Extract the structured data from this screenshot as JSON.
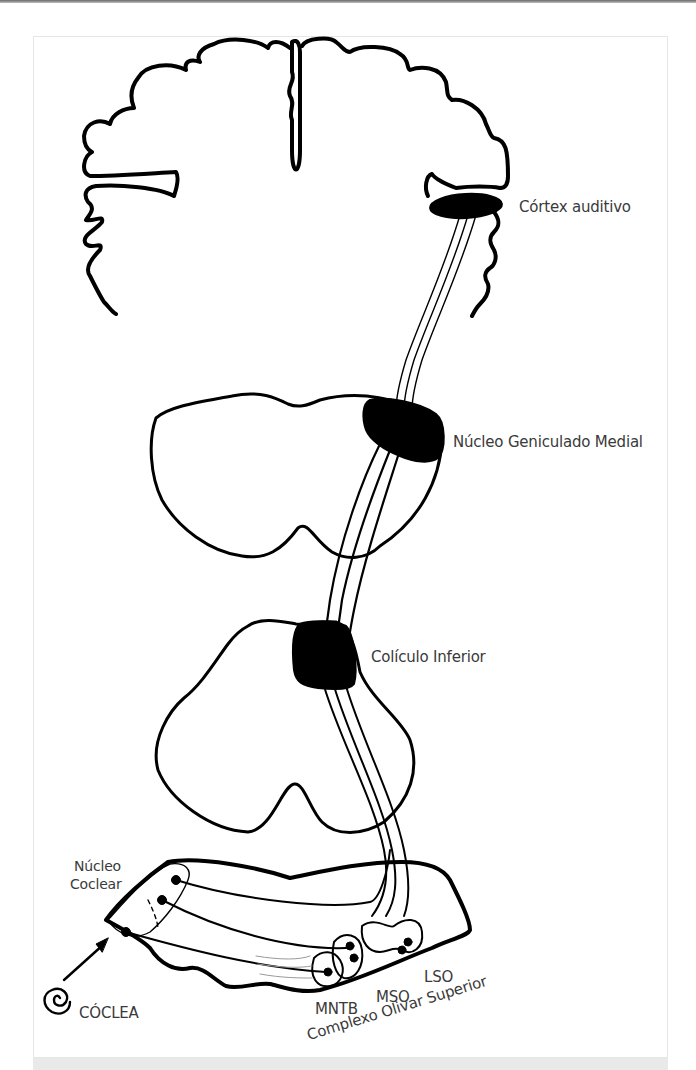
{
  "figure": {
    "labels": {
      "auditory_cortex": "Córtex auditivo",
      "medial_geniculate": "Núcleo Geniculado Medial",
      "inferior_colliculus": "Colículo Inferior",
      "cochlear_nucleus_line1": "Núcleo",
      "cochlear_nucleus_line2": "Coclear",
      "cochlea": "CÓCLEA",
      "mntb": "MNTB",
      "mso": "MSO",
      "lso": "LSO",
      "superior_olivary_complex": "Complexo Olivar Superior"
    },
    "structures": [
      "cerebral-cortex",
      "thalamus",
      "midbrain",
      "brainstem-pons",
      "cochlea"
    ],
    "colors": {
      "stroke": "#000000",
      "text": "#3a3a3a",
      "fill_nucleus": "#000000",
      "background": "#ffffff",
      "band": "#e9e9e9"
    }
  }
}
